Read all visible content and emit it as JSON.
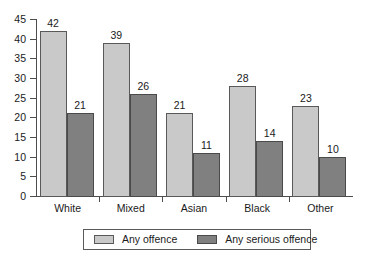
{
  "chart_data": {
    "type": "bar",
    "title": "",
    "subtitle": "",
    "xlabel": "",
    "ylabel": "",
    "categories": [
      "White",
      "Mixed",
      "Asian",
      "Black",
      "Other"
    ],
    "series": [
      {
        "name": "Any offence",
        "color": "#c9c9c9",
        "values": [
          42,
          39,
          21,
          28,
          23
        ]
      },
      {
        "name": "Any serious offence",
        "color": "#808080",
        "values": [
          21,
          26,
          11,
          14,
          10
        ]
      }
    ],
    "ylim": [
      0,
      45
    ],
    "y_ticks": [
      0,
      5,
      10,
      15,
      20,
      25,
      30,
      35,
      40,
      45
    ],
    "y_tick_labels": [
      "0",
      "5",
      "10",
      "15",
      "20",
      "25",
      "30",
      "35",
      "40",
      "45"
    ],
    "grid": false,
    "data_labels": true,
    "legend": {
      "position": "bottom",
      "boxed": true,
      "entries": [
        {
          "label": "Any offence",
          "swatch": "light-gray-swatch"
        },
        {
          "label": "Any serious offence",
          "swatch": "dark-gray-swatch"
        }
      ]
    }
  }
}
